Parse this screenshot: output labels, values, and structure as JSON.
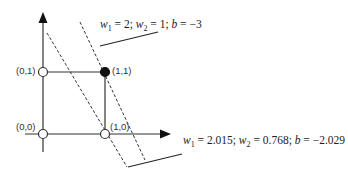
{
  "diagram": {
    "type": "perceptron-decision-boundary",
    "axes": {
      "x_axis": "horizontal arrow",
      "y_axis": "vertical arrow"
    },
    "points": [
      {
        "label": "(0,0)",
        "filled": false
      },
      {
        "label": "(1,0)",
        "filled": false
      },
      {
        "label": "(0,1)",
        "filled": false
      },
      {
        "label": "(1,1)",
        "filled": true
      }
    ],
    "boundaries": [
      {
        "name": "initial",
        "w1_sym": "w",
        "w1_sub": "1",
        "w1_val": " = 2; ",
        "w2_sym": "w",
        "w2_sub": "2",
        "w2_val": " = 1; ",
        "b_sym": "b",
        "b_val": " = −3"
      },
      {
        "name": "trained",
        "w1_sym": "w",
        "w1_sub": "1",
        "w1_val": " = 2.015; ",
        "w2_sym": "w",
        "w2_sub": "2",
        "w2_val": " = 0.768; ",
        "b_sym": "b",
        "b_val": " = −2.029"
      }
    ],
    "colors": {
      "line": "#333333",
      "point_filled": "#111111",
      "point_empty": "#ffffff"
    }
  }
}
